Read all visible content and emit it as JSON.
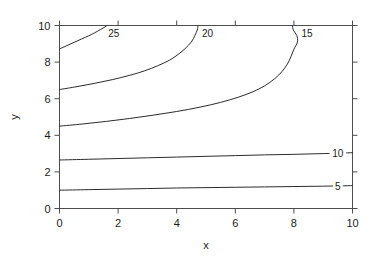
{
  "figure": {
    "background_color": "#ffffff",
    "line_color": "#2b2b2b",
    "axis_color": "#4d4d4d",
    "text_color": "#1a1a1a"
  },
  "chart_data": {
    "type": "line",
    "subtype": "contour",
    "title": "",
    "xlabel": "x",
    "ylabel": "y",
    "xlim": [
      0,
      10
    ],
    "ylim": [
      0,
      10
    ],
    "xticks": [
      0,
      2,
      4,
      6,
      8,
      10
    ],
    "yticks": [
      0,
      2,
      4,
      6,
      8,
      10
    ],
    "xtick_labels": [
      "0",
      "2",
      "4",
      "6",
      "8",
      "10"
    ],
    "ytick_labels": [
      "0",
      "2",
      "4",
      "6",
      "8",
      "10"
    ],
    "grid": false,
    "legend": "none",
    "levels": [
      5,
      10,
      15,
      20,
      25
    ],
    "contours": [
      {
        "level": 5,
        "label": "5",
        "label_x": 9.5,
        "label_y": 1.22,
        "points": [
          [
            0.0,
            1.0
          ],
          [
            1.0,
            1.03
          ],
          [
            2.0,
            1.06
          ],
          [
            3.0,
            1.09
          ],
          [
            4.0,
            1.12
          ],
          [
            5.0,
            1.14
          ],
          [
            6.0,
            1.16
          ],
          [
            7.0,
            1.18
          ],
          [
            8.0,
            1.2
          ],
          [
            9.0,
            1.22
          ],
          [
            10.0,
            1.25
          ]
        ]
      },
      {
        "level": 10,
        "label": "10",
        "label_x": 9.5,
        "label_y": 3.0,
        "points": [
          [
            0.0,
            2.65
          ],
          [
            1.0,
            2.69
          ],
          [
            2.0,
            2.73
          ],
          [
            3.0,
            2.77
          ],
          [
            4.0,
            2.81
          ],
          [
            5.0,
            2.85
          ],
          [
            6.0,
            2.89
          ],
          [
            7.0,
            2.93
          ],
          [
            8.0,
            2.96
          ],
          [
            9.0,
            3.0
          ],
          [
            10.0,
            3.05
          ]
        ]
      },
      {
        "level": 15,
        "label": "15",
        "label_x": 8.45,
        "label_y": 9.55,
        "points": [
          [
            0.0,
            4.5
          ],
          [
            0.8,
            4.62
          ],
          [
            1.6,
            4.76
          ],
          [
            2.4,
            4.92
          ],
          [
            3.2,
            5.1
          ],
          [
            4.0,
            5.3
          ],
          [
            4.8,
            5.54
          ],
          [
            5.5,
            5.8
          ],
          [
            6.1,
            6.08
          ],
          [
            6.6,
            6.38
          ],
          [
            7.0,
            6.7
          ],
          [
            7.35,
            7.1
          ],
          [
            7.6,
            7.5
          ],
          [
            7.78,
            7.9
          ],
          [
            7.9,
            8.3
          ],
          [
            8.0,
            8.7
          ],
          [
            8.12,
            9.1
          ],
          [
            8.1,
            9.45
          ],
          [
            7.98,
            9.75
          ],
          [
            7.95,
            10.0
          ]
        ]
      },
      {
        "level": 20,
        "label": "20",
        "label_x": 5.05,
        "label_y": 9.55,
        "points": [
          [
            0.0,
            6.5
          ],
          [
            0.6,
            6.66
          ],
          [
            1.2,
            6.84
          ],
          [
            1.8,
            7.04
          ],
          [
            2.4,
            7.28
          ],
          [
            2.9,
            7.52
          ],
          [
            3.35,
            7.8
          ],
          [
            3.75,
            8.1
          ],
          [
            4.05,
            8.42
          ],
          [
            4.3,
            8.76
          ],
          [
            4.5,
            9.1
          ],
          [
            4.62,
            9.45
          ],
          [
            4.7,
            9.75
          ],
          [
            4.73,
            10.0
          ]
        ]
      },
      {
        "level": 25,
        "label": "25",
        "label_x": 1.85,
        "label_y": 9.55,
        "points": [
          [
            0.0,
            8.72
          ],
          [
            0.25,
            8.9
          ],
          [
            0.5,
            9.08
          ],
          [
            0.75,
            9.26
          ],
          [
            1.0,
            9.44
          ],
          [
            1.2,
            9.6
          ],
          [
            1.4,
            9.78
          ],
          [
            1.55,
            9.92
          ],
          [
            1.62,
            10.0
          ]
        ]
      }
    ]
  }
}
